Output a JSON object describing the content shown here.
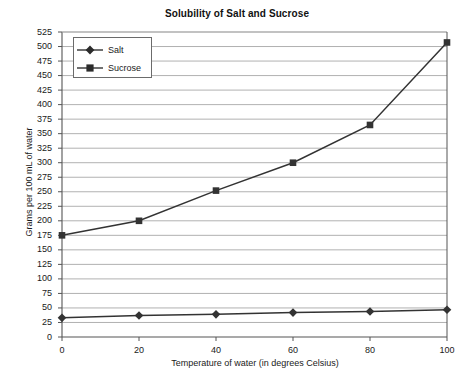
{
  "chart_data": {
    "type": "line",
    "title": "Solubility of Salt and Sucrose",
    "xlabel": "Temperature of water (in degrees Celsius)",
    "ylabel": "Grams per 100 mL of water",
    "x": [
      0,
      20,
      40,
      60,
      80,
      100
    ],
    "xlim": [
      0,
      100
    ],
    "ylim": [
      0,
      525
    ],
    "xticks": [
      "0",
      "20",
      "40",
      "60",
      "80",
      "100"
    ],
    "yticks": [
      "0",
      "25",
      "50",
      "75",
      "100",
      "125",
      "150",
      "175",
      "200",
      "225",
      "250",
      "275",
      "300",
      "325",
      "350",
      "375",
      "400",
      "425",
      "450",
      "475",
      "500",
      "525"
    ],
    "grid": "horizontal",
    "legend_position": "top-left",
    "series": [
      {
        "name": "Salt",
        "marker": "diamond",
        "color": "#333333",
        "values": [
          33,
          37,
          39,
          42,
          44,
          47
        ]
      },
      {
        "name": "Sucrose",
        "marker": "square",
        "color": "#333333",
        "values": [
          175,
          200,
          252,
          300,
          365,
          507
        ]
      }
    ]
  },
  "colors": {
    "axis": "#555555",
    "grid": "#a8a8a8",
    "series": "#333333",
    "text": "#1a1a1a",
    "background": "#ffffff"
  }
}
